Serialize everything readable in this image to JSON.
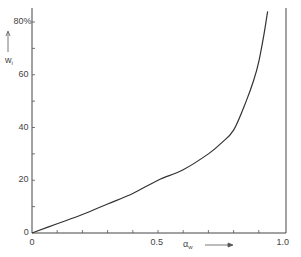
{
  "chart_data": {
    "type": "line",
    "title": "",
    "xlabel": "α_w",
    "ylabel": "w_i",
    "xlim": [
      0,
      1.0
    ],
    "ylim": [
      0,
      80
    ],
    "x_tick_labels": [
      "0",
      "0.5",
      "1.0"
    ],
    "x_minor_ticks": [
      0.1,
      0.2,
      0.3,
      0.4,
      0.6,
      0.7,
      0.8,
      0.9
    ],
    "y_tick_labels": [
      "0",
      "20",
      "40",
      "60",
      "80%"
    ],
    "y_minor_ticks": [
      10,
      30,
      50,
      70
    ],
    "grid": false,
    "legend": null,
    "series": [
      {
        "name": "w_i",
        "x": [
          0,
          0.1,
          0.2,
          0.3,
          0.4,
          0.5,
          0.6,
          0.7,
          0.75,
          0.8,
          0.85,
          0.88,
          0.9,
          0.92,
          0.935
        ],
        "y": [
          0,
          3.5,
          7,
          11,
          15,
          20,
          24,
          30,
          34,
          39,
          50,
          58,
          65,
          75,
          84
        ]
      }
    ]
  },
  "axes": {
    "x_label_main": "α",
    "x_label_sub": "w",
    "y_label_main": "w",
    "y_label_sub": "i",
    "origin_x": "0",
    "origin_y": "0"
  }
}
